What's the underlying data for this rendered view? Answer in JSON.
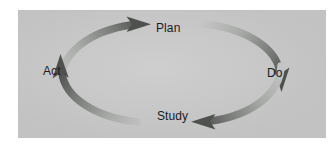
{
  "figure": {
    "name": "pdsa-cycle-diagram",
    "kind": "cycle-diagram",
    "direction": "clockwise",
    "panel_color": "#c8c9c8",
    "page_background": "#ffffff",
    "label_color": "#1c1c1c",
    "arrow_dark_color": "#585a58",
    "arrow_light_color": "#bcbdbc"
  },
  "nodes": [
    {
      "id": "plan",
      "label": "Plan",
      "position": "top"
    },
    {
      "id": "do",
      "label": "Do",
      "position": "right"
    },
    {
      "id": "study",
      "label": "Study",
      "position": "bottom"
    },
    {
      "id": "act",
      "label": "Act",
      "position": "left"
    }
  ],
  "arrows": [
    {
      "id": "act-to-plan",
      "from": "Act",
      "to": "Plan",
      "quadrant": "upper-left",
      "fade": "light-tail-to-dark-head"
    },
    {
      "id": "plan-to-do",
      "from": "Plan",
      "to": "Do",
      "quadrant": "upper-right",
      "fade": "light-tail-to-dark-head"
    },
    {
      "id": "do-to-study",
      "from": "Do",
      "to": "Study",
      "quadrant": "lower-right",
      "fade": "light-tail-to-dark-head"
    },
    {
      "id": "study-to-act",
      "from": "Study",
      "to": "Act",
      "quadrant": "lower-left",
      "fade": "light-tail-to-dark-head"
    }
  ]
}
